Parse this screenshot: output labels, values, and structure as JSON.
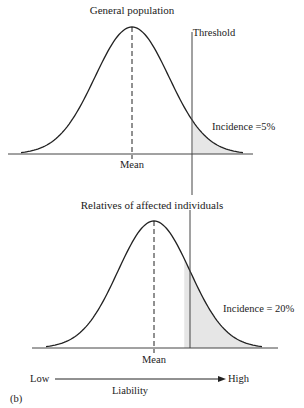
{
  "chart_data": [
    {
      "type": "area",
      "title": "General population",
      "threshold_label": "Threshold",
      "mean_label": "Mean",
      "annotation": "Incidence =5%",
      "incidence_percent": 5,
      "distribution": "normal",
      "mean": 0,
      "sd": 1,
      "threshold_sd": 1.645,
      "xlim": [
        -3.2,
        3.6
      ]
    },
    {
      "type": "area",
      "title": "Relatives of affected individuals",
      "mean_label": "Mean",
      "annotation": "Incidence = 20%",
      "incidence_percent": 20,
      "distribution": "normal",
      "mean": 0,
      "sd": 1,
      "threshold_sd": 0.84,
      "xlim": [
        -3.2,
        3.6
      ]
    }
  ],
  "axis": {
    "low_label": "Low",
    "high_label": "High",
    "label": "Liability"
  },
  "panel_label": "(b)",
  "colors": {
    "line": "#222222",
    "shade": "#e6e6e6"
  }
}
